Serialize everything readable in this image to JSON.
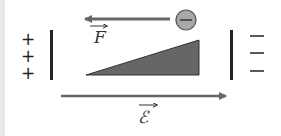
{
  "diagram": {
    "left_plate_charges": [
      "+",
      "+",
      "+"
    ],
    "right_plate_charges": [
      "−",
      "−",
      "−"
    ],
    "particle_sign": "−",
    "force_label": "F",
    "field_label": "ℰ",
    "colors": {
      "arrow": "#666666",
      "plate": "#222222",
      "wedge": "#666666",
      "particle_fill": "#a8a8a8",
      "particle_stroke": "#555555"
    }
  }
}
